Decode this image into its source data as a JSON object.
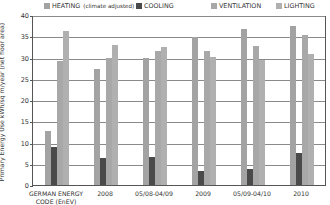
{
  "chart_data": {
    "type": "bar",
    "title": "",
    "xlabel": "",
    "ylabel": "Primary Energy Use kWh/sq m/year (net floor area)",
    "ylim": [
      0,
      40
    ],
    "yticks": [
      0,
      5,
      10,
      15,
      20,
      25,
      30,
      35,
      40
    ],
    "grid": true,
    "legend_position": "top",
    "categories": [
      "GERMAN ENERGY CODE (EnEV)",
      "2008",
      "05/08-04/09",
      "2009",
      "05/09-04/10",
      "2010"
    ],
    "category_lines": [
      [
        "GERMAN ENERGY",
        "CODE (EnEV)"
      ],
      [
        "2008"
      ],
      [
        "05/08-04/09"
      ],
      [
        "2009"
      ],
      [
        "05/09-04/10"
      ],
      [
        "2010"
      ]
    ],
    "series": [
      {
        "name": "HEATING",
        "note": "(climate adjusted)",
        "color": "#a3a3a3",
        "values": [
          12.8,
          27.3,
          30.0,
          34.8,
          36.8,
          37.3
        ]
      },
      {
        "name": "COOLING",
        "note": "",
        "color": "#4a4a4a",
        "values": [
          8.9,
          6.3,
          6.5,
          3.2,
          3.8,
          7.5
        ]
      },
      {
        "name": "VENTILATION",
        "note": "",
        "color": "#a8a8a8",
        "values": [
          29.2,
          30.0,
          31.5,
          31.5,
          32.7,
          35.3
        ]
      },
      {
        "name": "LIGHTING",
        "note": "",
        "color": "#b0b0b0",
        "values": [
          36.3,
          33.0,
          32.5,
          30.1,
          29.5,
          30.8
        ]
      }
    ]
  }
}
